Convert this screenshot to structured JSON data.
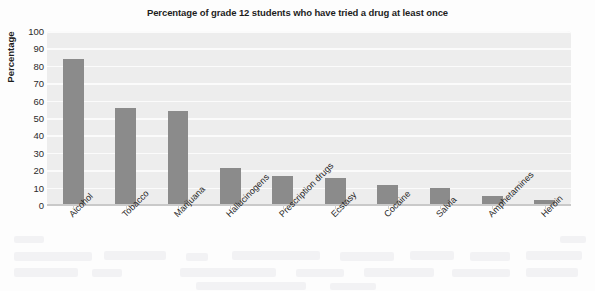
{
  "chart_data": {
    "type": "bar",
    "title": "Percentage of grade 12 students who have tried a drug at least once",
    "xlabel": "",
    "ylabel": "Percentage",
    "categories": [
      "Alcohol",
      "Tobacco",
      "Marijuana",
      "Hallucinogens",
      "Prescription drugs",
      "Ecstasy",
      "Cocaine",
      "Salvia",
      "Amphetamines",
      "Heroin"
    ],
    "values": [
      84,
      55.5,
      54,
      21,
      16.5,
      15.5,
      11.5,
      9.5,
      5,
      3
    ],
    "ylim": [
      0,
      100
    ],
    "yticks": [
      0,
      10,
      20,
      30,
      40,
      50,
      60,
      70,
      80,
      90,
      100
    ],
    "ytick_labels": [
      "0",
      "10",
      "20",
      "30",
      "40",
      "50",
      "60",
      "70",
      "80",
      "90",
      "100"
    ],
    "grid": true,
    "legend": false,
    "bar_color": "#8b8b8b",
    "plot_background": "#ededed",
    "gridline_color": "#fbfbfb",
    "label_rotation": -45
  }
}
